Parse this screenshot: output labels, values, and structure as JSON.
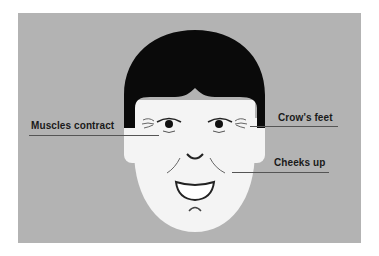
{
  "diagram": {
    "type": "annotated-illustration",
    "colors": {
      "background_panel": "#b3b3b3",
      "skin": "#f4f4f4",
      "hair": "#0a0a0a",
      "line": "#222222",
      "leader_line": "#555555",
      "label_text": "#1a1a1a"
    },
    "labels": [
      {
        "id": "muscles",
        "text": "Muscles contract",
        "side": "left"
      },
      {
        "id": "crows",
        "text": "Crow's feet",
        "side": "right"
      },
      {
        "id": "cheeks",
        "text": "Cheeks up",
        "side": "right"
      }
    ]
  }
}
